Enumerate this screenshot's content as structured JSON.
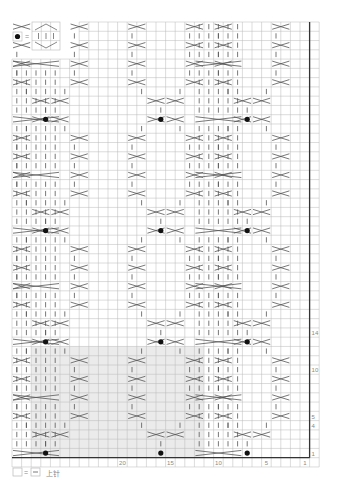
{
  "chart_data": {
    "type": "knitting-chart",
    "stitches": 31,
    "rows": 47,
    "stitch_labels": [
      {
        "stitch": 20,
        "label": "20"
      },
      {
        "stitch": 15,
        "label": "15"
      },
      {
        "stitch": 10,
        "label": "10"
      },
      {
        "stitch": 5,
        "label": "5"
      },
      {
        "stitch": 1,
        "label": "1"
      }
    ],
    "row_labels": [
      {
        "row": 1,
        "label": "1"
      },
      {
        "row": 4,
        "label": "4"
      },
      {
        "row": 5,
        "label": "5"
      },
      {
        "row": 10,
        "label": "10"
      },
      {
        "row": 14,
        "label": "14"
      }
    ],
    "top_step": {
      "start_col": 7,
      "rows_extra": 4
    },
    "shaded_region": {
      "col_from": 12,
      "col_to": 29,
      "row_from": 1,
      "row_to": 12
    },
    "bobble_rows": [
      1,
      13,
      25,
      37
    ],
    "bobble_cols": [
      4,
      15,
      24
    ],
    "cable_panels": [
      {
        "name": "wide-cable",
        "col_from": 8,
        "col_to": 12
      },
      {
        "name": "right-edge-cable",
        "col_from": 27,
        "col_to": 31
      }
    ]
  },
  "legend": {
    "bobble_key": "●",
    "equals": "=",
    "purl_text": "上针"
  },
  "colors": {
    "grid_line": "#b8b8b8",
    "border": "#333333",
    "shade": "#ebebeb",
    "symbol": "#555555",
    "bobble": "#111111",
    "label": "#888888"
  }
}
